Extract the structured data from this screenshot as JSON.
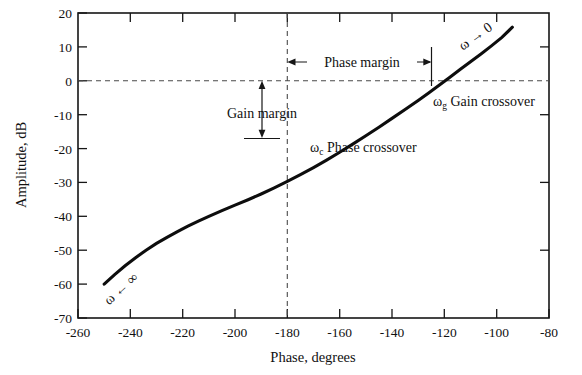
{
  "figure": {
    "background_color": "#ffffff",
    "curve_color": "#0d0d0d",
    "axis_color": "#161616",
    "dash_color": "#4a4a4a"
  },
  "axes": {
    "x_title": "Phase, degrees",
    "y_title": "Amplitude, dB",
    "x_ticks": [
      "-260",
      "-240",
      "-220",
      "-200",
      "-180",
      "-160",
      "-140",
      "-120",
      "-100",
      "-80"
    ],
    "y_ticks": [
      "20",
      "10",
      "0",
      "-10",
      "-20",
      "-30",
      "-40",
      "-50",
      "-60",
      "-70"
    ]
  },
  "annotations": {
    "phase_margin": "Phase margin",
    "gain_margin": "Gain margin",
    "phase_crossover_symbol": "ω",
    "phase_crossover_sub": "c",
    "phase_crossover_label": "Phase crossover",
    "gain_crossover_symbol": "ω",
    "gain_crossover_sub": "g",
    "gain_crossover_label": "Gain crossover",
    "omega_to_zero": "ω → 0",
    "omega_to_infinity": "ω ← ∞"
  },
  "chart_data": {
    "type": "line",
    "title": "",
    "xlabel": "Phase, degrees",
    "ylabel": "Amplitude, dB",
    "xlim": [
      -260,
      -80
    ],
    "ylim": [
      -70,
      20
    ],
    "xticks": [
      -260,
      -240,
      -220,
      -200,
      -180,
      -160,
      -120,
      -100,
      -80
    ],
    "yticks": [
      20,
      10,
      0,
      -10,
      -20,
      -30,
      -40,
      -50,
      -60,
      -70
    ],
    "grid": false,
    "legend": null,
    "series": [
      {
        "name": "Nichols chart open-loop response",
        "x": [
          -250,
          -246,
          -242,
          -238,
          -234,
          -230,
          -226,
          -222,
          -218,
          -214,
          -210,
          -205,
          -200,
          -195,
          -190,
          -185,
          -180,
          -175,
          -170,
          -165,
          -160,
          -155,
          -150,
          -145,
          -140,
          -135,
          -130,
          -126,
          -122,
          -118,
          -114,
          -110,
          -106,
          -102,
          -98,
          -94
        ],
        "y": [
          -60.0,
          -57.2,
          -54.6,
          -52.2,
          -50.0,
          -48.0,
          -46.2,
          -44.5,
          -42.9,
          -41.4,
          -40.0,
          -38.3,
          -36.7,
          -35.1,
          -33.4,
          -31.6,
          -29.7,
          -27.7,
          -25.6,
          -23.4,
          -21.1,
          -18.7,
          -16.2,
          -13.7,
          -11.1,
          -8.5,
          -5.8,
          -3.6,
          -1.3,
          1.0,
          3.3,
          5.6,
          7.9,
          10.3,
          12.8,
          15.8
        ]
      }
    ],
    "reference_lines": [
      {
        "name": "zero-db-line",
        "orientation": "horizontal",
        "value": 0,
        "style": "dashed"
      },
      {
        "name": "minus-180-deg-line",
        "orientation": "vertical",
        "value": -180,
        "style": "dashed"
      }
    ],
    "markers": [
      {
        "name": "phase-crossover",
        "x": -180,
        "y": -15.3,
        "label": "ωc Phase crossover"
      },
      {
        "name": "gain-crossover",
        "x": -127,
        "y": 0,
        "label": "ωg Gain crossover"
      }
    ],
    "measurements": [
      {
        "name": "gain-margin",
        "value_db": 15.3,
        "from": {
          "x": -190,
          "y": 0
        },
        "to": {
          "x": -190,
          "y": -15.3
        }
      },
      {
        "name": "phase-margin",
        "value_deg": 53,
        "from": {
          "x": -180,
          "y": 7.5
        },
        "to": {
          "x": -127,
          "y": 7.5
        }
      }
    ]
  }
}
